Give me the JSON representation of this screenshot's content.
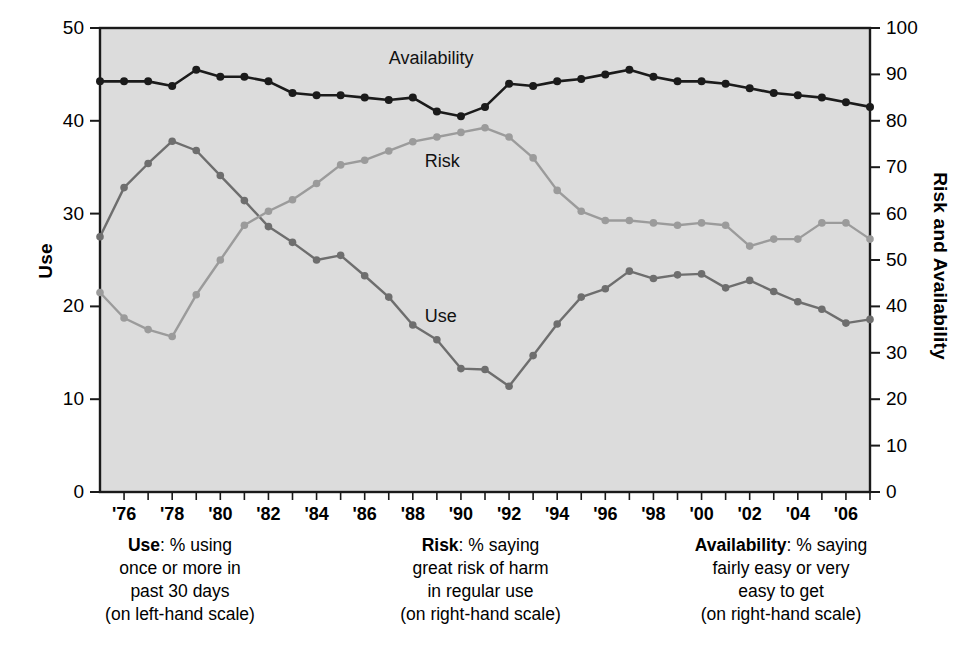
{
  "chart_data": {
    "type": "line",
    "title": "",
    "subtitle": "",
    "xlabel": "",
    "ylabel": "Use",
    "ylabel_right": "Risk and Availability",
    "ylim": [
      0,
      50
    ],
    "ylim_right": [
      0,
      100
    ],
    "xlim": [
      1975,
      2007
    ],
    "grid": false,
    "legend_position": "inline-annotations",
    "background": "#dcdcdc",
    "x": [
      1975,
      1976,
      1977,
      1978,
      1979,
      1980,
      1981,
      1982,
      1983,
      1984,
      1985,
      1986,
      1987,
      1988,
      1989,
      1990,
      1991,
      1992,
      1993,
      1994,
      1995,
      1996,
      1997,
      1998,
      1999,
      2000,
      2001,
      2002,
      2003,
      2004,
      2005,
      2006,
      2007
    ],
    "tick_labels_x": [
      "'76",
      "'78",
      "'80",
      "'82",
      "'84",
      "'86",
      "'88",
      "'90",
      "'92",
      "'94",
      "'96",
      "'98",
      "'00",
      "'02",
      "'04",
      "'06"
    ],
    "tick_values_x": [
      1976,
      1978,
      1980,
      1982,
      1984,
      1986,
      1988,
      1990,
      1992,
      1994,
      1996,
      1998,
      2000,
      2002,
      2004,
      2006
    ],
    "tick_labels_y_left": [
      "0",
      "10",
      "20",
      "30",
      "40",
      "50"
    ],
    "tick_values_y_left": [
      0,
      10,
      20,
      30,
      40,
      50
    ],
    "tick_labels_y_right": [
      "0",
      "10",
      "20",
      "30",
      "40",
      "50",
      "60",
      "70",
      "80",
      "90",
      "100"
    ],
    "tick_values_y_right": [
      0,
      10,
      20,
      30,
      40,
      50,
      60,
      70,
      80,
      90,
      100
    ],
    "series": [
      {
        "name": "Use",
        "axis": "left",
        "color": "#6e6e6e",
        "label_text": "Use",
        "values": [
          27.5,
          32.8,
          35.4,
          37.8,
          36.8,
          34.1,
          31.4,
          28.6,
          26.9,
          25.0,
          25.5,
          23.3,
          21.0,
          18.0,
          16.4,
          13.3,
          13.2,
          11.4,
          14.7,
          18.1,
          21.0,
          21.9,
          23.8,
          23.0,
          23.4,
          23.5,
          22.0,
          22.8,
          21.6,
          20.5,
          19.7,
          18.2,
          18.6
        ]
      },
      {
        "name": "Risk",
        "axis": "right",
        "color": "#9b9b9b",
        "label_text": "Risk",
        "values": [
          43.0,
          37.5,
          35.0,
          33.5,
          42.5,
          50.0,
          57.5,
          60.5,
          63.0,
          66.5,
          70.5,
          71.5,
          73.5,
          75.5,
          76.5,
          77.5,
          78.5,
          76.5,
          72.0,
          65.0,
          60.5,
          58.5,
          58.5,
          58.0,
          57.5,
          58.0,
          57.5,
          53.0,
          54.5,
          54.5,
          58.0,
          58.0,
          54.5
        ]
      },
      {
        "name": "Availability",
        "axis": "right",
        "color": "#1b1b1b",
        "label_text": "Availability",
        "values": [
          88.5,
          88.5,
          88.5,
          87.5,
          91.0,
          89.5,
          89.5,
          88.5,
          86.0,
          85.5,
          85.5,
          85.0,
          84.5,
          85.0,
          82.0,
          81.0,
          83.0,
          88.0,
          87.5,
          88.5,
          89.0,
          90.0,
          91.0,
          89.5,
          88.5,
          88.5,
          88.0,
          87.0,
          86.0,
          85.5,
          85.0,
          84.0,
          83.0
        ]
      }
    ],
    "annotations": [
      {
        "text": "Availability",
        "x": 1987.0,
        "y_right": 93.0
      },
      {
        "text": "Risk",
        "x": 1988.5,
        "y_right": 71.0
      },
      {
        "text": "Use",
        "x": 1988.5,
        "y_left": 18.8
      }
    ]
  },
  "captions": [
    {
      "key": "use",
      "bold": "Use",
      "lines": [
        "Use: % using",
        "once or more in",
        "past 30 days",
        "(on left-hand scale)"
      ]
    },
    {
      "key": "risk",
      "bold": "Risk",
      "lines": [
        "Risk: % saying",
        "great risk of harm",
        "in regular use",
        "(on right-hand scale)"
      ]
    },
    {
      "key": "availability",
      "bold": "Availability",
      "lines": [
        "Availability: % saying",
        "fairly easy or very",
        "easy to get",
        "(on right-hand scale)"
      ]
    }
  ],
  "axes": {
    "left_title": "Use",
    "right_title": "Risk and Availability"
  }
}
